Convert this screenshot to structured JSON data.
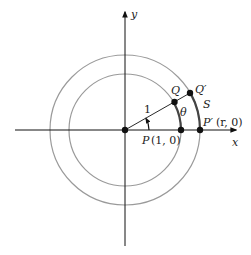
{
  "figure": {
    "axes": {
      "x_label": "x",
      "y_label": "y"
    },
    "points": {
      "origin": "",
      "P": {
        "name": "P",
        "coords": "(1, 0)"
      },
      "P_prime": {
        "name": "P′",
        "coords": "(r, 0)"
      },
      "Q": {
        "name": "Q"
      },
      "Q_prime": {
        "name": "Q′"
      }
    },
    "labels": {
      "radius": "1",
      "angle": "θ",
      "arc": "S"
    },
    "colors": {
      "ink": "#111111",
      "circle": "#9a9a9a",
      "arc": "#444444"
    }
  }
}
